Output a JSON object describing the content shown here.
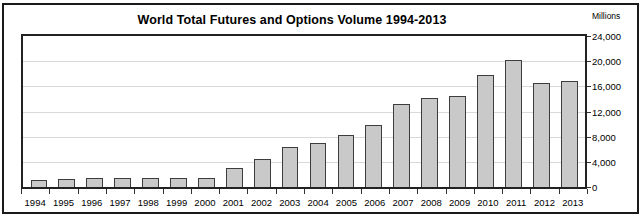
{
  "chart_data": {
    "type": "bar",
    "title": "World Total Futures and Options Volume 1994-2013",
    "units_label": "Millions",
    "xlabel": "",
    "ylabel": "Millions",
    "ylim": [
      0,
      24000
    ],
    "ytick_labels": [
      "24,000",
      "20,000",
      "16,000",
      "12,000",
      "8,000",
      "4,000",
      "0"
    ],
    "ytick_values": [
      24000,
      20000,
      16000,
      12000,
      8000,
      4000,
      0
    ],
    "grid": true,
    "legend": false,
    "categories": [
      "1994",
      "1995",
      "1996",
      "1997",
      "1998",
      "1999",
      "2000",
      "2001",
      "2002",
      "2003",
      "2004",
      "2005",
      "2006",
      "2007",
      "2008",
      "2009",
      "2010",
      "2011",
      "2012",
      "2013"
    ],
    "values": [
      1100,
      1300,
      1400,
      1400,
      1400,
      1400,
      1500,
      3100,
      4500,
      6300,
      7000,
      8300,
      9800,
      13200,
      14100,
      14400,
      17800,
      20200,
      16500,
      16800
    ],
    "series": [
      {
        "name": "World Total Futures and Options Volume",
        "values": [
          1100,
          1300,
          1400,
          1400,
          1400,
          1400,
          1500,
          3100,
          4500,
          6300,
          7000,
          8300,
          9800,
          13200,
          14100,
          14400,
          17800,
          20200,
          16500,
          16800
        ]
      }
    ],
    "bar_color": "#c9c9c9",
    "bar_border_color": "#3d3d3d"
  }
}
